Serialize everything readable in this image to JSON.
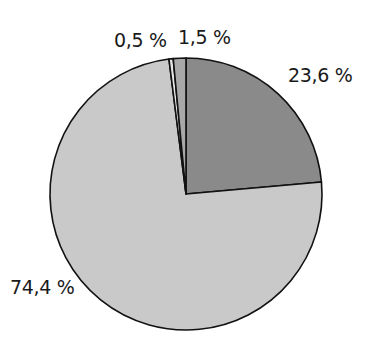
{
  "chart_data": {
    "type": "pie",
    "title": "",
    "start_angle_deg": 0,
    "direction": "clockwise",
    "slices": [
      {
        "label": "23,6 %",
        "value": 23.6,
        "color": "#8a8a8a"
      },
      {
        "label": "74,4 %",
        "value": 74.4,
        "color": "#c9c9c9"
      },
      {
        "label": "0,5 %",
        "value": 0.5,
        "color": "#e6e6e6"
      },
      {
        "label": "1,5 %",
        "value": 1.5,
        "color": "#a8a8a8"
      }
    ],
    "legend": "none",
    "grid": false
  },
  "labels": {
    "slice_0": "23,6 %",
    "slice_1": "74,4 %",
    "slice_2": "0,5 %",
    "slice_3": "1,5 %"
  }
}
